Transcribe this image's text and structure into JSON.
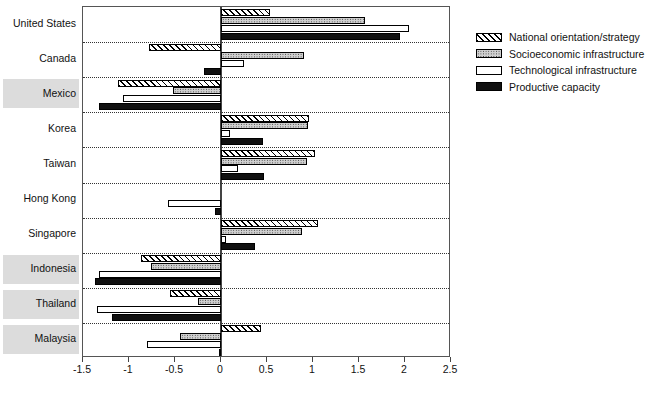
{
  "chart_data": {
    "type": "bar",
    "orientation": "horizontal",
    "title": "",
    "xlabel": "",
    "ylabel": "",
    "xlim": [
      -1.5,
      2.5
    ],
    "xticks": [
      "-1.5",
      "-1",
      "-0.5",
      "0",
      "0.5",
      "1",
      "1.5",
      "2",
      "2.5"
    ],
    "xtick_values": [
      -1.5,
      -1,
      -0.5,
      0,
      0.5,
      1,
      1.5,
      2,
      2.5
    ],
    "grid": false,
    "row_separators": "dotted",
    "legend_position": "right",
    "categories": [
      "United States",
      "Canada",
      "Mexico",
      "Korea",
      "Taiwan",
      "Hong Kong",
      "Singapore",
      "Indonesia",
      "Thailand",
      "Malaysia"
    ],
    "highlighted_categories": [
      "Mexico",
      "Indonesia",
      "Thailand",
      "Malaysia"
    ],
    "series": [
      {
        "name": "National orientation/strategy",
        "key": "nat",
        "pattern": "diagonal-hatch",
        "values": [
          0.53,
          -0.78,
          -1.12,
          0.96,
          1.02,
          0.0,
          1.05,
          -0.87,
          -0.55,
          0.43
        ]
      },
      {
        "name": "Socioeconomic infrastructure",
        "key": "soc",
        "pattern": "dotted-fill",
        "values": [
          1.56,
          0.9,
          -0.52,
          0.95,
          0.93,
          0.0,
          0.88,
          -0.76,
          -0.25,
          -0.45
        ]
      },
      {
        "name": "Technological infrastructure",
        "key": "tec",
        "pattern": "white-fill",
        "values": [
          2.04,
          0.25,
          -1.07,
          0.1,
          0.18,
          -0.58,
          0.05,
          -1.33,
          -1.35,
          -0.8
        ]
      },
      {
        "name": "Productive capacity",
        "key": "prod",
        "pattern": "black-fill",
        "values": [
          1.95,
          -0.18,
          -1.33,
          0.46,
          0.47,
          -0.07,
          0.37,
          -1.37,
          -1.18,
          -0.02
        ]
      }
    ],
    "legend": [
      {
        "label": "National orientation/strategy",
        "key": "nat"
      },
      {
        "label": "Socioeconomic infrastructure",
        "key": "soc"
      },
      {
        "label": "Technological infrastructure",
        "key": "tec"
      },
      {
        "label": "Productive capacity",
        "key": "prod"
      }
    ],
    "colors": {
      "axis": "#555555",
      "separator": "#333333",
      "highlight_band": "#dcdcdc",
      "black_fill": "#111111",
      "dotted_fill": "#cfcfcf",
      "white_fill": "#ffffff"
    }
  }
}
